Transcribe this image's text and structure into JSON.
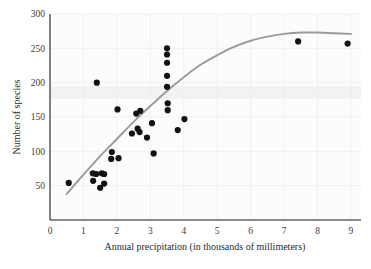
{
  "chart_data": {
    "type": "scatter",
    "title": "",
    "xlabel": "Annual precipitation (in thousands of millimeters)",
    "ylabel": "Number of species",
    "xlim": [
      0,
      9.3
    ],
    "ylim": [
      0,
      300
    ],
    "xticks": [
      0,
      1,
      2,
      3,
      4,
      5,
      6,
      7,
      8,
      9
    ],
    "xticklabels": [
      "0",
      "1",
      "2",
      "3",
      "4",
      "5",
      "6",
      "7",
      "8",
      "9"
    ],
    "yticks": [
      50,
      100,
      150,
      200,
      250,
      300
    ],
    "yticklabels": [
      "50",
      "100",
      "150",
      "200",
      "250",
      "300"
    ],
    "grid": true,
    "legend": false,
    "point_color": "#121212",
    "curve_color": "#9a9a9a",
    "points": [
      {
        "x": 0.56,
        "y": 54
      },
      {
        "x": 1.28,
        "y": 68
      },
      {
        "x": 1.38,
        "y": 67
      },
      {
        "x": 1.29,
        "y": 57
      },
      {
        "x": 1.4,
        "y": 200
      },
      {
        "x": 1.55,
        "y": 68
      },
      {
        "x": 1.62,
        "y": 67
      },
      {
        "x": 1.5,
        "y": 47
      },
      {
        "x": 1.62,
        "y": 53
      },
      {
        "x": 1.85,
        "y": 99
      },
      {
        "x": 1.83,
        "y": 89
      },
      {
        "x": 2.02,
        "y": 161
      },
      {
        "x": 2.05,
        "y": 90
      },
      {
        "x": 2.45,
        "y": 126
      },
      {
        "x": 2.58,
        "y": 155
      },
      {
        "x": 2.7,
        "y": 159
      },
      {
        "x": 2.68,
        "y": 128
      },
      {
        "x": 2.62,
        "y": 133
      },
      {
        "x": 2.9,
        "y": 120
      },
      {
        "x": 3.05,
        "y": 141
      },
      {
        "x": 3.1,
        "y": 97
      },
      {
        "x": 3.5,
        "y": 250
      },
      {
        "x": 3.5,
        "y": 241
      },
      {
        "x": 3.5,
        "y": 229
      },
      {
        "x": 3.5,
        "y": 210
      },
      {
        "x": 3.5,
        "y": 194
      },
      {
        "x": 3.52,
        "y": 170
      },
      {
        "x": 3.52,
        "y": 160
      },
      {
        "x": 3.82,
        "y": 131
      },
      {
        "x": 4.02,
        "y": 147
      },
      {
        "x": 7.42,
        "y": 260
      },
      {
        "x": 8.9,
        "y": 257
      }
    ],
    "trend_curve": {
      "description": "smooth concave increasing fitted curve",
      "points": [
        {
          "x": 0.5,
          "y": 38
        },
        {
          "x": 1.0,
          "y": 66
        },
        {
          "x": 1.5,
          "y": 93
        },
        {
          "x": 2.0,
          "y": 118
        },
        {
          "x": 2.5,
          "y": 143
        },
        {
          "x": 3.0,
          "y": 166
        },
        {
          "x": 3.5,
          "y": 188
        },
        {
          "x": 4.0,
          "y": 208
        },
        {
          "x": 4.5,
          "y": 226
        },
        {
          "x": 5.0,
          "y": 240
        },
        {
          "x": 5.5,
          "y": 252
        },
        {
          "x": 6.0,
          "y": 261
        },
        {
          "x": 6.5,
          "y": 267
        },
        {
          "x": 7.0,
          "y": 271
        },
        {
          "x": 7.5,
          "y": 273
        },
        {
          "x": 8.0,
          "y": 273
        },
        {
          "x": 8.5,
          "y": 272
        },
        {
          "x": 9.0,
          "y": 271
        }
      ]
    }
  }
}
